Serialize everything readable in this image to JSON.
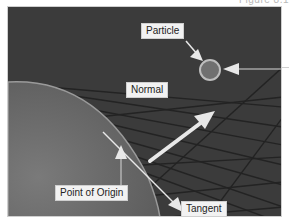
{
  "figure": {
    "caption_fragment": "Figure 8.1",
    "background_color": "#3b3b3b",
    "sphere_color": "#6e6e6e",
    "grid_line_color": "#222222",
    "arrow_color": "#e8e8e8",
    "particle_color": "#7a7a7a",
    "labels": {
      "particle": "Particle",
      "normal": "Normal",
      "point_of_origin": "Point of Origin",
      "tangent": "Tangent"
    }
  }
}
